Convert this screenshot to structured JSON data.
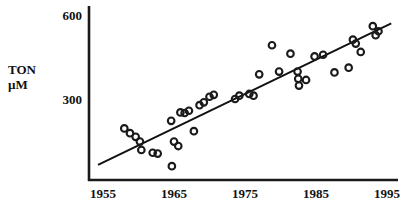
{
  "chart_data": {
    "type": "scatter",
    "title": "",
    "xlabel": "",
    "ylabel": "TON\nµM",
    "ylabel_lines": [
      "TON",
      "µM"
    ],
    "xlim": [
      1955,
      1996
    ],
    "ylim": [
      0,
      640
    ],
    "grid": false,
    "legend": null,
    "xticks": [
      1955,
      1965,
      1975,
      1985,
      1995
    ],
    "xtick_labels": [
      "1955",
      "1965",
      "1975",
      "1985",
      "1995"
    ],
    "yticks": [
      300,
      600
    ],
    "ytick_labels": [
      "300",
      "600"
    ],
    "marker": "open-circle",
    "marker_color": "#1a1a1a",
    "series": [
      {
        "name": "TON",
        "points": [
          [
            1958.0,
            195
          ],
          [
            1958.8,
            178
          ],
          [
            1959.6,
            165
          ],
          [
            1960.2,
            148
          ],
          [
            1960.4,
            118
          ],
          [
            1962.0,
            108
          ],
          [
            1962.7,
            105
          ],
          [
            1964.6,
            222
          ],
          [
            1964.7,
            60
          ],
          [
            1965.0,
            148
          ],
          [
            1965.6,
            132
          ],
          [
            1965.9,
            252
          ],
          [
            1966.5,
            250
          ],
          [
            1967.1,
            258
          ],
          [
            1967.8,
            185
          ],
          [
            1968.6,
            278
          ],
          [
            1969.2,
            288
          ],
          [
            1970.0,
            308
          ],
          [
            1970.6,
            315
          ],
          [
            1973.6,
            300
          ],
          [
            1974.2,
            312
          ],
          [
            1975.6,
            318
          ],
          [
            1976.2,
            312
          ],
          [
            1977.0,
            388
          ],
          [
            1978.8,
            492
          ],
          [
            1979.8,
            398
          ],
          [
            1981.4,
            462
          ],
          [
            1982.4,
            398
          ],
          [
            1982.5,
            372
          ],
          [
            1982.6,
            348
          ],
          [
            1983.6,
            368
          ],
          [
            1984.8,
            452
          ],
          [
            1986.0,
            458
          ],
          [
            1987.6,
            395
          ],
          [
            1989.6,
            412
          ],
          [
            1990.2,
            512
          ],
          [
            1990.6,
            498
          ],
          [
            1991.3,
            468
          ],
          [
            1993.0,
            560
          ],
          [
            1993.4,
            528
          ],
          [
            1993.8,
            542
          ]
        ]
      }
    ],
    "trendline": {
      "type": "linear-fit",
      "x_start": 1954.3,
      "y_start": 65,
      "x_end": 1995.6,
      "y_end": 570,
      "style": "solid",
      "color": "#111111"
    }
  },
  "axes": {
    "y_axis_name": "y-axis",
    "x_axis_name": "x-axis"
  }
}
